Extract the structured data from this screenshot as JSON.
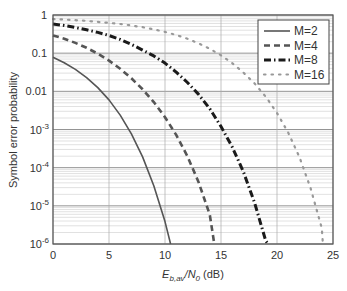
{
  "chart_data": {
    "type": "line",
    "title": "",
    "xlabel": "E_b,av/N_0 (dB)",
    "xlabel_parts": {
      "E": "E",
      "sub1": "b,av",
      "slash": "/N",
      "sub2": "0",
      "unit": " (dB)"
    },
    "ylabel": "Symbol error probability",
    "xlim": [
      0,
      25
    ],
    "ylim": [
      1e-06,
      1
    ],
    "yscale": "log",
    "grid": true,
    "legend_position": "upper right",
    "x_ticks": [
      0,
      5,
      10,
      15,
      20,
      25
    ],
    "x_tick_labels": [
      "0",
      "5",
      "10",
      "15",
      "20",
      "25"
    ],
    "y_ticks": [
      1,
      0.1,
      0.01,
      0.001,
      0.0001,
      1e-05,
      1e-06
    ],
    "y_tick_labels": [
      {
        "base": "1",
        "exp": ""
      },
      {
        "base": "0.1",
        "exp": ""
      },
      {
        "base": "0.01",
        "exp": ""
      },
      {
        "base": "10",
        "exp": "-3"
      },
      {
        "base": "10",
        "exp": "-4"
      },
      {
        "base": "10",
        "exp": "-5"
      },
      {
        "base": "10",
        "exp": "-6"
      }
    ],
    "series": [
      {
        "name": "M=2",
        "style": "solid",
        "x": [
          0,
          1,
          2,
          3,
          4,
          5,
          6,
          7,
          8,
          9,
          10,
          10.5
        ],
        "values": [
          0.0786,
          0.0563,
          0.0375,
          0.0229,
          0.0125,
          0.00595,
          0.00239,
          0.000773,
          0.000191,
          3.36e-05,
          3.87e-06,
          1e-06
        ]
      },
      {
        "name": "M=4",
        "style": "dashed",
        "x": [
          0,
          1,
          2,
          3,
          4,
          5,
          6,
          7,
          8,
          9,
          10,
          11,
          12,
          13,
          14,
          14.4
        ],
        "values": [
          0.292,
          0.239,
          0.186,
          0.138,
          0.0969,
          0.0637,
          0.039,
          0.022,
          0.0113,
          0.00522,
          0.0021,
          0.000722,
          0.0002,
          4.16e-05,
          5.82e-06,
          1e-06
        ]
      },
      {
        "name": "M=8",
        "style": "dashdot",
        "x": [
          0,
          1,
          2,
          3,
          4,
          5,
          6,
          7,
          8,
          9,
          10,
          11,
          12,
          13,
          14,
          15,
          16,
          17,
          18,
          19,
          19.2
        ],
        "values": [
          0.58,
          0.53,
          0.47,
          0.41,
          0.35,
          0.29,
          0.23,
          0.17,
          0.12,
          0.085,
          0.055,
          0.032,
          0.017,
          0.0083,
          0.0035,
          0.0012,
          0.00035,
          7.8e-05,
          1.2e-05,
          1.2e-06,
          1e-06
        ]
      },
      {
        "name": "M=16",
        "style": "dotted",
        "x": [
          0,
          1,
          2,
          3,
          4,
          5,
          6,
          7,
          8,
          9,
          10,
          11,
          12,
          13,
          14,
          15,
          16,
          17,
          18,
          19,
          20,
          21,
          22,
          23,
          24,
          24.1
        ],
        "values": [
          0.78,
          0.76,
          0.73,
          0.7,
          0.66,
          0.62,
          0.58,
          0.53,
          0.48,
          0.42,
          0.36,
          0.3,
          0.24,
          0.18,
          0.13,
          0.088,
          0.055,
          0.031,
          0.016,
          0.0072,
          0.0027,
          0.00083,
          0.00019,
          2.9e-05,
          2.6e-06,
          1e-06
        ]
      }
    ]
  },
  "legend": {
    "items": [
      {
        "label": "M=2",
        "style": "solid"
      },
      {
        "label": "M=4",
        "style": "dashed"
      },
      {
        "label": "M=8",
        "style": "dashdot"
      },
      {
        "label": "M=16",
        "style": "dotted"
      }
    ]
  },
  "colors": {
    "m2": "#555555",
    "m4": "#555555",
    "m8": "#1a1a1a",
    "m16": "#999999",
    "grid_major": "#888888",
    "grid_minor": "#cccccc",
    "axis": "#555555"
  }
}
